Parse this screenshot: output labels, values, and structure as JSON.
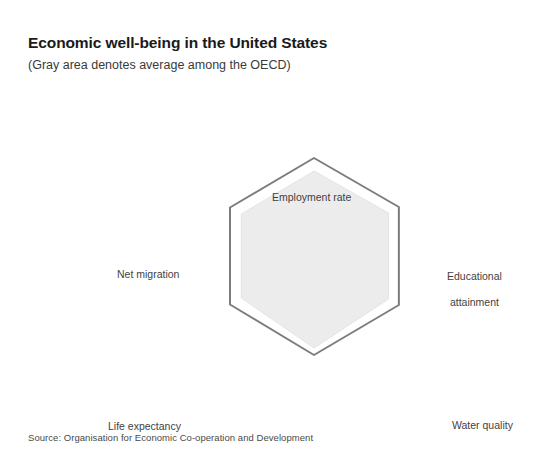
{
  "header": {
    "title": "Economic well-being in the United States",
    "subtitle": "(Gray area denotes average among the OECD)"
  },
  "footer": {
    "source": "Source: Organisation for Economic Co-operation and Development"
  },
  "colors": {
    "outline_series": "#7d7d7d",
    "area_fill": "#ececec",
    "area_stroke": "#e4e4e4",
    "background": "#ffffff",
    "title_text": "#1a1a1a",
    "label_text": "#3f3f3f"
  },
  "chart_data": {
    "type": "radar",
    "title": "Economic well-being in the United States",
    "subtitle": "(Gray area denotes average among the OECD)",
    "categories": [
      "Employment rate",
      "Educational attainment",
      "Water quality",
      "Voter turnout",
      "Life expectancy",
      "Net migration"
    ],
    "category_label_lines": [
      [
        "Employment rate"
      ],
      [
        "Educational",
        "attainment"
      ],
      [
        "Water quality"
      ],
      [
        "Voter turnout"
      ],
      [
        "Life expectancy"
      ],
      [
        "Net migration"
      ]
    ],
    "rlim": [
      0,
      1
    ],
    "grid": false,
    "tick_labels": [],
    "legend": {
      "position": "none",
      "entries": [
        {
          "name": "United States",
          "style": "gray outline"
        },
        {
          "name": "OECD average",
          "style": "gray filled area"
        }
      ]
    },
    "series": [
      {
        "name": "United States",
        "fill": "none",
        "stroke": "#7d7d7d",
        "values": [
          0.98,
          0.98,
          0.98,
          0.99,
          0.97,
          0.97
        ]
      },
      {
        "name": "OECD average",
        "fill": "#ececec",
        "stroke": "#e4e4e4",
        "values": [
          0.85,
          0.86,
          0.86,
          0.92,
          0.84,
          0.84
        ]
      }
    ],
    "annotations": [
      "Source: Organisation for Economic Co-operation and Development"
    ]
  },
  "geometry": {
    "center_x": 314,
    "center_y": 164,
    "max_radius": 100,
    "angles_deg": [
      90,
      30,
      -30,
      -90,
      -150,
      150
    ]
  }
}
